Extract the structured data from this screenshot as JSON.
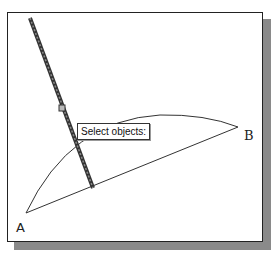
{
  "viewport": {
    "tooltip": {
      "text": "Select objects:"
    },
    "points": [
      {
        "name": "A",
        "label": "A"
      },
      {
        "name": "B",
        "label": "B"
      }
    ],
    "geometry": {
      "arc": "arc from A to B bulging upward",
      "chord": "line from A to B",
      "selected_line": "thick highlighted line crossing the arc"
    },
    "colors": {
      "background": "#ffffff",
      "frame": "#222222",
      "shadow": "#8a8a8a",
      "lines": "#333333",
      "selected_line": "#444444"
    }
  }
}
